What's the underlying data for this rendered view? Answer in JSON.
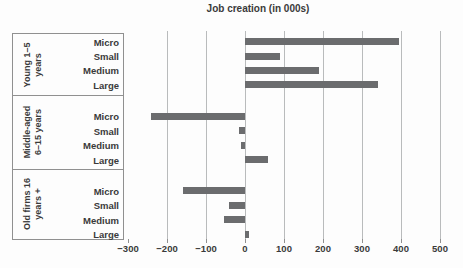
{
  "chart_data": {
    "type": "bar",
    "orientation": "horizontal",
    "title": "Job creation (in 000s)",
    "size_categories": [
      "Micro",
      "Small",
      "Medium",
      "Large"
    ],
    "groups": [
      {
        "key": "young",
        "label_line1": "Young 1–5",
        "label_line2": "years",
        "values": [
          395,
          90,
          190,
          340
        ]
      },
      {
        "key": "middle-aged",
        "label_line1": "Middle-aged",
        "label_line2": "6–15 years",
        "values": [
          -240,
          -15,
          -10,
          60
        ]
      },
      {
        "key": "old-firms",
        "label_line1": "Old firms 16",
        "label_line2": "years +",
        "values": [
          -160,
          -40,
          -55,
          10
        ]
      }
    ],
    "x_axis": {
      "min": -300,
      "max": 500,
      "tick_values": [
        -300,
        -200,
        -100,
        0,
        100,
        200,
        300,
        400,
        500
      ],
      "tick_labels": [
        "−300",
        "−200",
        "−100",
        "0",
        "100",
        "200",
        "300",
        "400",
        "500"
      ],
      "gridlines": [
        -200,
        -100,
        0,
        100,
        200,
        300,
        400,
        500
      ]
    },
    "legend": null,
    "grid": "vertical-only",
    "bar_color": "#6b6c6e",
    "gridline_color": "#b9bbbc",
    "border_color": "#909090",
    "text_color": "#3a3a3a",
    "background_color": "#fdfdfd"
  }
}
